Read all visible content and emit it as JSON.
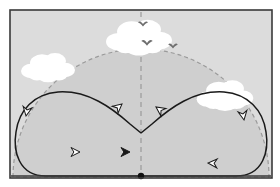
{
  "figure": {
    "frame": {
      "border_color": "#3a3a3a",
      "border_width": 1.6,
      "x": 10,
      "y": 10,
      "width": 262,
      "height": 168,
      "sky_color": "#dcdcdc",
      "outside_color": "#ffffff"
    },
    "dome": {
      "label": "dashed-semicircular-boundary",
      "center_x": 141,
      "center_y": 177,
      "radius": 128,
      "fill_color": "#cfcfcf",
      "stroke_color": "#9a9a9a",
      "dash": "4,3",
      "stroke_width": 1.2
    },
    "centerline": {
      "label": "vertical-dashed-centerline",
      "x": 141,
      "y_top": 12,
      "y_bottom": 176,
      "stroke_color": "#9a9a9a",
      "dash": "5,4",
      "stroke_width": 1.2
    },
    "origin_dot": {
      "label": "origin-marker",
      "x": 141,
      "y": 176,
      "radius": 3.2,
      "color": "#111111"
    },
    "baseline": {
      "label": "ground-baseline",
      "x1": 11,
      "x2": 271,
      "y": 176,
      "color": "#3a3a3a",
      "stroke_width": 1.6
    },
    "path": {
      "label": "figure-eight-flight-path",
      "stroke_color": "#1a1a1a",
      "stroke_width": 1.5,
      "left_loop_d": "M 141 176 L 46 176 C 18 176 13 150 16 132 C 19 110 34 94 58 92 C 88 90 112 108 130 124 L 141 133",
      "right_loop_d": "M 141 133 L 152 124 C 170 108 194 90 224 92 C 248 94 263 110 266 132 C 269 150 264 176 236 176 L 141 176",
      "left_loop_path_d": "M 141 152 L 74 152 C 44 152 26 140 24 121 C 22 100 38 84 62 82 C 92 80 118 98 136 112 L 146 103",
      "direction": "counterclockwise-left-lobe-clockwise-right-lobe"
    },
    "arrowheads": [
      {
        "name": "arrowhead-solid-bottom-center",
        "x": 130,
        "y": 152,
        "angle": 0,
        "style": "solid",
        "size": 9
      },
      {
        "name": "arrowhead-open-bottom-left",
        "x": 80,
        "y": 152,
        "angle": 0,
        "style": "open",
        "size": 9
      },
      {
        "name": "arrowhead-open-left-descend",
        "x": 26,
        "y": 116,
        "angle": 100,
        "style": "open",
        "size": 9
      },
      {
        "name": "arrowhead-open-diagonal-up",
        "x": 122,
        "y": 104,
        "angle": -40,
        "style": "open",
        "size": 9
      },
      {
        "name": "arrowhead-open-center-cross",
        "x": 156,
        "y": 107,
        "angle": 215,
        "style": "open",
        "size": 9
      },
      {
        "name": "arrowhead-open-right-descend",
        "x": 244,
        "y": 120,
        "angle": 80,
        "style": "open",
        "size": 9
      },
      {
        "name": "arrowhead-open-bottom-right",
        "x": 208,
        "y": 163,
        "angle": 183,
        "style": "open",
        "size": 9
      }
    ],
    "clouds": [
      {
        "name": "cloud-left",
        "cx": 48,
        "cy": 68,
        "scale": 1.0
      },
      {
        "name": "cloud-center",
        "cx": 139,
        "cy": 38,
        "scale": 1.22
      },
      {
        "name": "cloud-right",
        "cx": 225,
        "cy": 96,
        "scale": 1.05
      }
    ],
    "cloud_color": "#ffffff",
    "birds": [
      {
        "name": "bird-upper",
        "cx": 143,
        "cy": 24,
        "scale": 0.85
      },
      {
        "name": "bird-center",
        "cx": 147,
        "cy": 43,
        "scale": 0.95
      },
      {
        "name": "bird-right",
        "cx": 173,
        "cy": 46,
        "scale": 0.8
      }
    ],
    "bird_color": "#6e6e6e"
  }
}
